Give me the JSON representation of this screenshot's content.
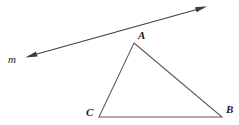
{
  "figure": {
    "canvas": {
      "width": 239,
      "height": 125,
      "background": "#ffffff"
    },
    "labels": {
      "line_m": "m",
      "vertex_a": "A",
      "vertex_b": "B",
      "vertex_c": "C"
    },
    "colors": {
      "line_stroke": "#3d3d3d",
      "triangle_stroke": "#5a5a5a",
      "label_text": "#1c1c1c",
      "arrowhead_fill": "#3d3d3d"
    },
    "geometry": {
      "line_m": {
        "type": "double-headed-arrow",
        "start": {
          "x": 26,
          "y": 57
        },
        "end": {
          "x": 206,
          "y": 7
        },
        "stroke_width": 1
      },
      "triangle_abc": {
        "type": "triangle",
        "vertices": {
          "A": {
            "x": 134,
            "y": 43
          },
          "B": {
            "x": 222,
            "y": 117
          },
          "C": {
            "x": 99,
            "y": 117
          }
        },
        "stroke_width": 1
      }
    }
  }
}
